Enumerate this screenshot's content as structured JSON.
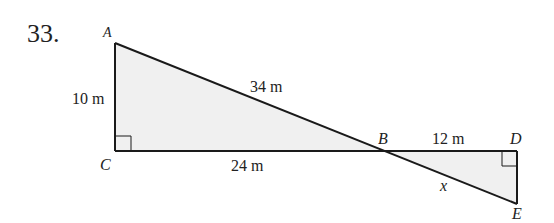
{
  "problem": {
    "number": "33."
  },
  "diagram": {
    "colors": {
      "fill": "#f0f0f0",
      "stroke": "#1a1a1a",
      "text": "#222222",
      "background": "#ffffff"
    },
    "vertices": {
      "A": {
        "label": "A",
        "x": 115,
        "y": 43
      },
      "B": {
        "label": "B",
        "x": 385,
        "y": 151
      },
      "C": {
        "label": "C",
        "x": 115,
        "y": 151
      },
      "D": {
        "label": "D",
        "x": 517,
        "y": 151
      },
      "E": {
        "label": "E",
        "x": 517,
        "y": 204
      }
    },
    "segments": {
      "AC": {
        "label": "10 m"
      },
      "AB": {
        "label": "34 m"
      },
      "CB": {
        "label": "24 m"
      },
      "BD": {
        "label": "12 m"
      },
      "BE": {
        "label": "x"
      }
    },
    "right_angles": [
      "C",
      "D"
    ]
  }
}
